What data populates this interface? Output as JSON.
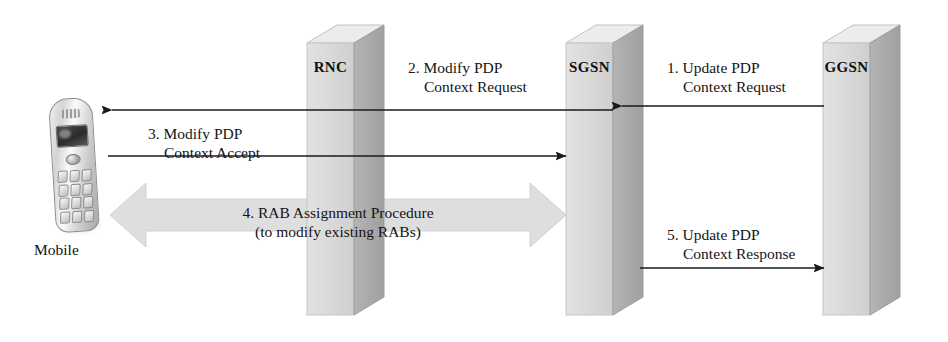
{
  "diagram": {
    "background_color": "#ffffff",
    "pillar_front_color": "#d9d9d9",
    "pillar_side_color": "#a9a9a9",
    "pillar_top_color": "#e8e8e8",
    "block_arrow_color": "#dcdcdc",
    "line_color": "#1a1a1a"
  },
  "nodes": [
    {
      "id": "mobile",
      "label": "Mobile",
      "type": "handset"
    },
    {
      "id": "rnc",
      "label": "RNC",
      "type": "pillar"
    },
    {
      "id": "sgsn",
      "label": "SGSN",
      "type": "pillar"
    },
    {
      "id": "ggsn",
      "label": "GGSN",
      "type": "pillar"
    }
  ],
  "messages": [
    {
      "number": "1.",
      "line1": "1. Update PDP",
      "line2": "Context Request",
      "from": "ggsn",
      "to": "sgsn",
      "direction": "left",
      "style": "line-arrow"
    },
    {
      "number": "2.",
      "line1": "2. Modify PDP",
      "line2": "Context Request",
      "from": "sgsn",
      "to": "mobile",
      "direction": "left",
      "style": "line-arrow"
    },
    {
      "number": "3.",
      "line1": "3. Modify PDP",
      "line2": "Context Accept",
      "from": "mobile",
      "to": "sgsn",
      "direction": "right",
      "style": "line-arrow"
    },
    {
      "number": "4.",
      "line1": "4. RAB Assignment Procedure",
      "line2": "(to modify existing RABs)",
      "from": "mobile",
      "to": "sgsn",
      "direction": "both",
      "style": "block-arrow"
    },
    {
      "number": "5.",
      "line1": "5. Update PDP",
      "line2": "Context Response",
      "from": "sgsn",
      "to": "ggsn",
      "direction": "right",
      "style": "line-arrow"
    }
  ]
}
